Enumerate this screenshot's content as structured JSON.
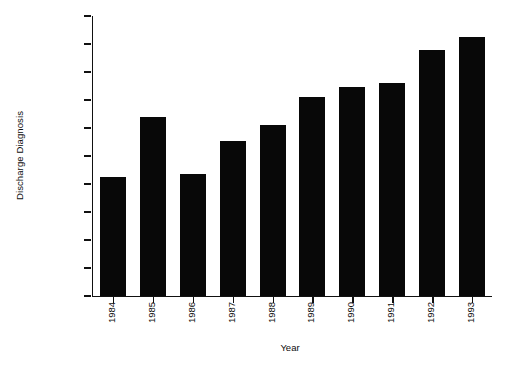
{
  "chart_data": {
    "type": "bar",
    "title": "",
    "xlabel": "Year",
    "ylabel": "Discharge Diagnosis",
    "categories": [
      "1984",
      "1985",
      "1986",
      "1987",
      "1988",
      "1989",
      "1990",
      "1991",
      "1992",
      "1993"
    ],
    "values": [
      425,
      640,
      435,
      555,
      610,
      710,
      748,
      760,
      880,
      925
    ],
    "ylim": [
      0,
      1000
    ],
    "yticks": [
      0,
      100,
      200,
      300,
      400,
      500,
      600,
      700,
      800,
      900,
      1000
    ],
    "ytick_labels": [
      "0",
      "100",
      "200",
      "300",
      "400",
      "500",
      "600",
      "700",
      "800",
      "900",
      "1000"
    ],
    "grid": false,
    "legend": null,
    "bar_color": "#080808",
    "axis_color": "#111111",
    "background_color": "#ffffff"
  }
}
